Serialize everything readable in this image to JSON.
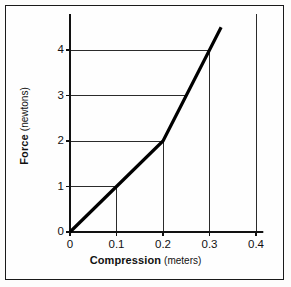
{
  "chart_data": {
    "type": "line",
    "title": "",
    "xlabel": "Compression (meters)",
    "xlabel_main": "Compression",
    "xlabel_unit": "(meters)",
    "ylabel": "Force (newtons)",
    "ylabel_main": "Force",
    "ylabel_unit": "(newtons)",
    "xlim": [
      0,
      0.42
    ],
    "ylim": [
      0,
      4.6
    ],
    "xticks": [
      0,
      0.1,
      0.2,
      0.3,
      0.4
    ],
    "xtick_labels": [
      "0",
      "0.1",
      "0.2",
      "0.3",
      "0.4"
    ],
    "yticks": [
      0,
      1,
      2,
      3,
      4
    ],
    "ytick_labels": [
      "0",
      "1",
      "2",
      "3",
      "4"
    ],
    "grid": false,
    "legend": null,
    "series": [
      {
        "name": "Force vs Compression",
        "x": [
          0,
          0.1,
          0.2,
          0.25,
          0.3,
          0.325
        ],
        "values": [
          0,
          1,
          2,
          3,
          4,
          4.5
        ],
        "color": "#000000",
        "linewidth": 3.2
      }
    ],
    "guide_lines_horizontal": [
      {
        "y": 1,
        "x_from": 0,
        "x_to": 0.1
      },
      {
        "y": 2,
        "x_from": 0,
        "x_to": 0.2
      },
      {
        "y": 3,
        "x_from": 0,
        "x_to": 0.25
      },
      {
        "y": 4,
        "x_from": 0,
        "x_to": 0.3
      }
    ],
    "guide_lines_vertical": [
      {
        "x": 0.1,
        "y_from": 0,
        "y_to": 1
      },
      {
        "x": 0.2,
        "y_from": 0,
        "y_to": 2
      },
      {
        "x": 0.3,
        "y_from": 0,
        "y_to": 4
      },
      {
        "x": 0.4,
        "y_from": 0,
        "y_to": 4.6
      }
    ],
    "annotations": []
  }
}
